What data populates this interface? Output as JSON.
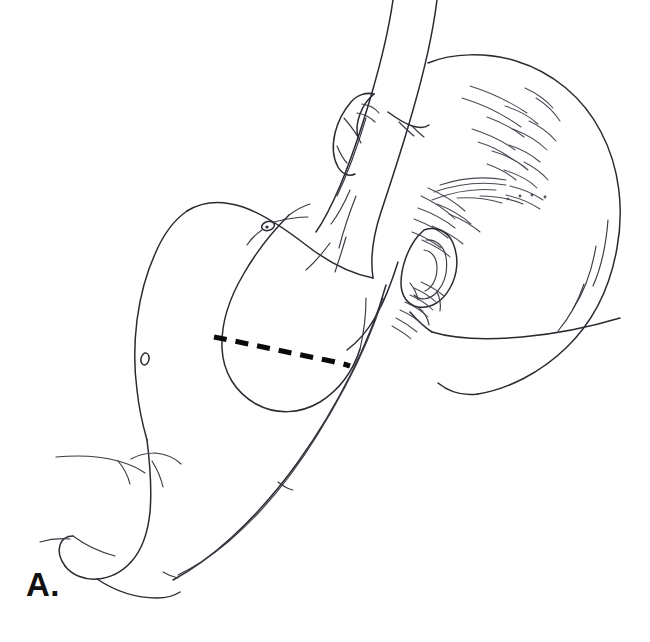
{
  "figure": {
    "panel_label": "A.",
    "caption_text": "",
    "view": "lateral / side view of chest and trunk",
    "medium": "black-and-white line drawing",
    "background_color": "#ffffff",
    "line_color": "#2a2a33",
    "incision_color": "#0a0a0a",
    "label_color": "#111111",
    "annotations": [
      {
        "name": "incision-marking",
        "style": "dashed",
        "description": "dashed incision line across lateral chest wall",
        "color": "#0a0a0a"
      }
    ],
    "anatomy_parts": [
      "head",
      "hair",
      "ear",
      "neck",
      "raised-arm",
      "hand",
      "shoulder",
      "chest-wall",
      "nipple",
      "breast-contour",
      "flank",
      "abdomen",
      "hip",
      "thigh",
      "buttock"
    ]
  }
}
